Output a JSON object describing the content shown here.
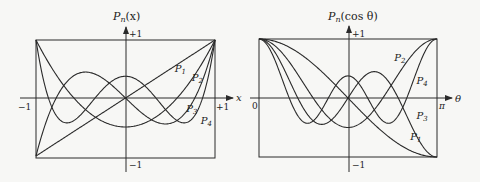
{
  "chart_data": [
    {
      "type": "line",
      "title": "",
      "ylabel": "P_n(x)",
      "xlabel": "x",
      "xlim": [
        -1,
        1
      ],
      "ylim": [
        -1,
        1
      ],
      "x_tick_labels": [
        "−1",
        "+1"
      ],
      "y_tick_labels": [
        "+1",
        "−1"
      ],
      "grid": false,
      "legend": "inline curve labels",
      "series": [
        {
          "name": "P1",
          "label": "P",
          "sub": "1",
          "function": "x",
          "label_pos": [
            0.55,
            0.45
          ]
        },
        {
          "name": "P2",
          "label": "P",
          "sub": "2",
          "function": "(3x^2-1)/2",
          "label_pos": [
            0.74,
            0.3
          ]
        },
        {
          "name": "P3",
          "label": "P",
          "sub": "3",
          "function": "(5x^3-3x)/2",
          "label_pos": [
            0.68,
            -0.24
          ]
        },
        {
          "name": "P4",
          "label": "P",
          "sub": "4",
          "function": "(35x^4-30x^2+3)/8",
          "label_pos": [
            0.84,
            -0.45
          ]
        }
      ]
    },
    {
      "type": "line",
      "title": "",
      "ylabel": "P_n(cos θ)",
      "xlabel": "θ",
      "xlim": [
        0,
        3.14159
      ],
      "ylim": [
        -1,
        1
      ],
      "x_tick_labels": [
        "0",
        "π"
      ],
      "y_tick_labels": [
        "+1",
        "−1"
      ],
      "grid": false,
      "legend": "inline curve labels",
      "series": [
        {
          "name": "P1",
          "label": "P",
          "sub": "1",
          "function": "cos θ",
          "label_pos": [
            0.7,
            -0.72
          ]
        },
        {
          "name": "P2",
          "label": "P",
          "sub": "2",
          "function": "(3cos²θ-1)/2",
          "label_pos": [
            0.52,
            0.62
          ]
        },
        {
          "name": "P3",
          "label": "P",
          "sub": "3",
          "function": "(5cos³θ-3cosθ)/2",
          "label_pos": [
            0.77,
            -0.36
          ]
        },
        {
          "name": "P4",
          "label": "P",
          "sub": "4",
          "function": "(35cos⁴θ-30cos²θ+3)/8",
          "label_pos": [
            0.77,
            0.24
          ]
        }
      ]
    }
  ],
  "left": {
    "ylabel_base": "P",
    "ylabel_sub": "n",
    "ylabel_arg": "(x)",
    "top_tick": "+1",
    "bottom_tick": "−1",
    "xmin_tick": "−1",
    "xmax_tick": "+1",
    "axis_var": "x"
  },
  "right": {
    "ylabel_base": "P",
    "ylabel_sub": "n",
    "ylabel_arg": "(cos θ)",
    "top_tick": "+1",
    "bottom_tick": "−1",
    "xmin_tick": "0",
    "xmax_tick": "π",
    "axis_var": "θ"
  },
  "colors": {
    "line": "#2a2a2a",
    "background": "#f7f7f5"
  }
}
